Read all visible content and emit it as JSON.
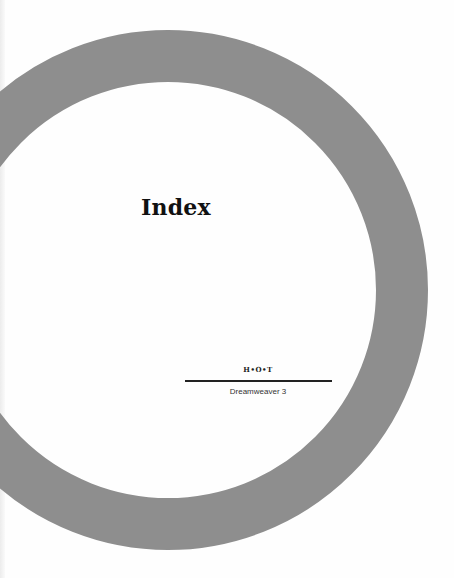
{
  "page": {
    "title": "Index",
    "series_mark": "H•O•T",
    "book_title": "Dreamweaver 3"
  },
  "colors": {
    "ring": "#8e8e8e",
    "background": "#ffffff",
    "text": "#111111"
  }
}
